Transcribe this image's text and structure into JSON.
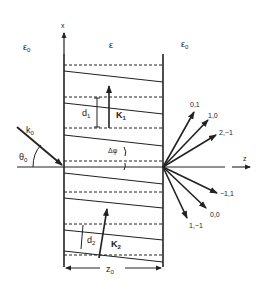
{
  "diagram": {
    "type": "volume-grating-diffraction",
    "regions": {
      "left_medium": "ε0",
      "grating": "ε",
      "right_medium": "ε0"
    },
    "axes": {
      "x_label": "x",
      "z_label": "z"
    },
    "incident": {
      "wavevector_label": "k0",
      "wavevector_main": "k",
      "wavevector_sub": "0",
      "angle_main": "θ",
      "angle_sub": "0"
    },
    "gratings": [
      {
        "vector_main": "K",
        "vector_sub": "1",
        "period_main": "d",
        "period_sub": "1"
      },
      {
        "vector_main": "K",
        "vector_sub": "2",
        "period_main": "d",
        "period_sub": "2"
      }
    ],
    "tilt_label": "Δφ",
    "thickness": {
      "main": "z",
      "sub": "0"
    },
    "diffraction_orders": [
      "0,1",
      "1,0",
      "2,−1",
      "−1,1",
      "0,0",
      "1,−1"
    ],
    "colors": {
      "line": "#222222",
      "background": "#ffffff"
    }
  }
}
